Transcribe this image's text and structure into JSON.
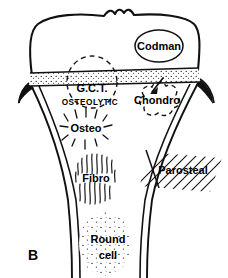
{
  "figure": {
    "panel_label": "B",
    "ink_color": "#111111",
    "background_color": "#ffffff"
  },
  "labels": {
    "codman": "Codman",
    "gct": "G.C.T.",
    "osteolytic": "OSTEOLYTIC",
    "chondro": "Chondro",
    "osteo": "Osteo",
    "fibro": "Fibro",
    "parosteal": "Parosteal",
    "round_cell_line1": "Round",
    "round_cell_line2": "cell"
  },
  "regions": [
    {
      "name": "epiphysis",
      "label": "Codman"
    },
    {
      "name": "growth-plate-band",
      "label": ""
    },
    {
      "name": "gct-zone",
      "label": "G.C.T."
    },
    {
      "name": "chondro-zone",
      "label": "Chondro"
    },
    {
      "name": "osteo-zone",
      "label": "Osteo"
    },
    {
      "name": "fibro-zone",
      "label": "Fibro"
    },
    {
      "name": "parosteal-zone",
      "label": "Parosteal"
    },
    {
      "name": "round-cell-zone",
      "label": "Round cell"
    }
  ]
}
